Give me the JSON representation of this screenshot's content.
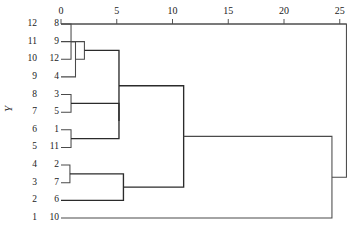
{
  "figure": {
    "kind": "dendrogram",
    "axis_title": "Y",
    "background": "#ffffff",
    "line_color": "#4a4a4a",
    "accent_line_color": "#2b2b2b"
  },
  "axis": {
    "position": "top",
    "ticks": [
      {
        "value": 0,
        "label": "0"
      },
      {
        "value": 5,
        "label": "5"
      },
      {
        "value": 10,
        "label": "10"
      },
      {
        "value": 15,
        "label": "15"
      },
      {
        "value": 20,
        "label": "20"
      },
      {
        "value": 25,
        "label": "25"
      }
    ],
    "range": [
      0,
      26.5
    ]
  },
  "row_labels": [
    "12",
    "11",
    "10",
    "9",
    "8",
    "7",
    "6",
    "5",
    "4",
    "3",
    "2",
    "1"
  ],
  "leaf_labels": [
    "8",
    "9",
    "12",
    "4",
    "3",
    "5",
    "1",
    "11",
    "2",
    "7",
    "6",
    "10"
  ],
  "chart_data": {
    "type": "dendrogram",
    "title": "",
    "xlabel": "",
    "ylabel": "Y",
    "orientation": "horizontal",
    "xlim": [
      0,
      26.5
    ],
    "xticks": [
      0,
      5,
      10,
      15,
      20,
      25
    ],
    "grid": false,
    "leaf_order_top_to_bottom": [
      "8",
      "9",
      "12",
      "4",
      "3",
      "5",
      "1",
      "11",
      "2",
      "7",
      "6",
      "10"
    ],
    "row_axis_labels_top_to_bottom": [
      "12",
      "11",
      "10",
      "9",
      "8",
      "7",
      "6",
      "5",
      "4",
      "3",
      "2",
      "1"
    ],
    "merges": [
      {
        "id": "m1",
        "left": "8",
        "right": "12",
        "distance": 0.9
      },
      {
        "id": "m2",
        "left": "9",
        "right": "4",
        "distance": 1.3
      },
      {
        "id": "m3",
        "left": "m1",
        "right": "m2",
        "distance": 2.1
      },
      {
        "id": "m4",
        "left": "3",
        "right": "5",
        "distance": 0.9
      },
      {
        "id": "m5",
        "left": "1",
        "right": "11",
        "distance": 0.9
      },
      {
        "id": "m6",
        "left": "m4",
        "right": "m5",
        "distance": 5.2
      },
      {
        "id": "m7",
        "left": "m3",
        "right": "m6",
        "distance": 5.2
      },
      {
        "id": "m8",
        "left": "2",
        "right": "7",
        "distance": 0.8
      },
      {
        "id": "m9",
        "left": "m8",
        "right": "6",
        "distance": 5.6
      },
      {
        "id": "m10",
        "left": "m7",
        "right": "m9",
        "distance": 11.0
      },
      {
        "id": "m11",
        "left": "m10",
        "right": "10",
        "distance": 24.3
      },
      {
        "id": "m12",
        "left": "m11",
        "right": "root",
        "distance": 25.6
      }
    ]
  }
}
